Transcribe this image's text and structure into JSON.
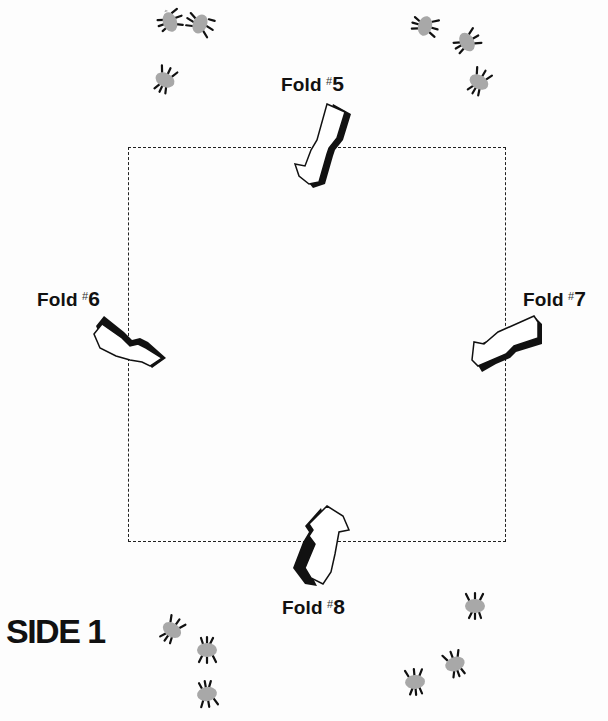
{
  "page": {
    "side_label": "SIDE 1",
    "background": "#ffffff",
    "line_color": "#222222",
    "bug_color": "#a8a8a8"
  },
  "folds": [
    {
      "id": 5,
      "prefix": "Fold",
      "hash": "#",
      "number": "5",
      "position": "top",
      "arrow_direction": "down-into-square"
    },
    {
      "id": 6,
      "prefix": "Fold",
      "hash": "#",
      "number": "6",
      "position": "left",
      "arrow_direction": "right-into-square"
    },
    {
      "id": 7,
      "prefix": "Fold",
      "hash": "#",
      "number": "7",
      "position": "right",
      "arrow_direction": "left-into-square"
    },
    {
      "id": 8,
      "prefix": "Fold",
      "hash": "#",
      "number": "8",
      "position": "bottom",
      "arrow_direction": "up-into-square"
    }
  ],
  "fold_guide": {
    "shape": "dashed-square"
  },
  "decorations": {
    "bug_groups": [
      {
        "corner": "top-left",
        "count": 3
      },
      {
        "corner": "top-right",
        "count": 3
      },
      {
        "corner": "bottom-left",
        "count": 3
      },
      {
        "corner": "bottom-right",
        "count": 3
      }
    ]
  }
}
